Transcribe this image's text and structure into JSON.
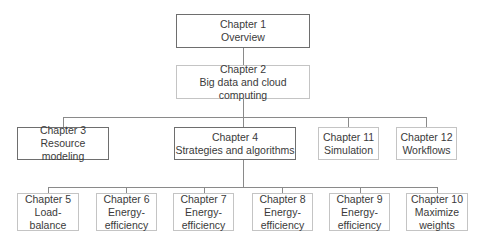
{
  "nodes": {
    "ch1": {
      "title": "Chapter 1",
      "lines": [
        "Overview"
      ]
    },
    "ch2": {
      "title": "Chapter 2",
      "lines": [
        "Big data and cloud computing"
      ]
    },
    "ch3": {
      "title": "Chapter 3",
      "lines": [
        "Resource modeling"
      ]
    },
    "ch4": {
      "title": "Chapter 4",
      "lines": [
        "Strategies and algorithms"
      ]
    },
    "ch11": {
      "title": "Chapter 11",
      "lines": [
        "Simulation"
      ]
    },
    "ch12": {
      "title": "Chapter 12",
      "lines": [
        "Workflows"
      ]
    },
    "ch5": {
      "title": "Chapter 5",
      "lines": [
        "Load-",
        "balance"
      ]
    },
    "ch6": {
      "title": "Chapter 6",
      "lines": [
        "Energy-",
        "efficiency"
      ]
    },
    "ch7": {
      "title": "Chapter 7",
      "lines": [
        "Energy-",
        "efficiency"
      ]
    },
    "ch8": {
      "title": "Chapter 8",
      "lines": [
        "Energy-",
        "efficiency"
      ]
    },
    "ch9": {
      "title": "Chapter 9",
      "lines": [
        "Energy-",
        "efficiency"
      ]
    },
    "ch10": {
      "title": "Chapter 10",
      "lines": [
        "Maximize",
        "weights"
      ]
    }
  },
  "edges": [
    [
      "ch1",
      "ch2"
    ],
    [
      "ch2",
      "ch3"
    ],
    [
      "ch2",
      "ch4"
    ],
    [
      "ch2",
      "ch11"
    ],
    [
      "ch2",
      "ch12"
    ],
    [
      "ch4",
      "ch5"
    ],
    [
      "ch4",
      "ch6"
    ],
    [
      "ch4",
      "ch7"
    ],
    [
      "ch4",
      "ch8"
    ],
    [
      "ch4",
      "ch9"
    ],
    [
      "ch4",
      "ch10"
    ]
  ],
  "colors": {
    "dark_border": "#6e6e6e",
    "light_border": "#c4c4c4",
    "connector": "#8a8a8a",
    "text": "#3a3a3a"
  }
}
